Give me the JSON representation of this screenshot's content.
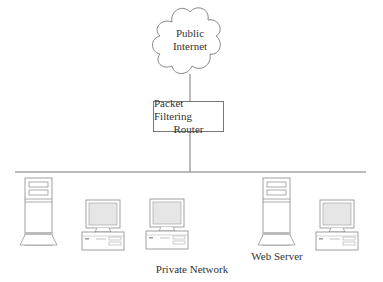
{
  "diagram": {
    "cloud": {
      "line1": "Public",
      "line2": "Internet"
    },
    "router": {
      "line1": "Packet Filtering",
      "line2": "Router"
    },
    "nodes": [
      {
        "type": "tower-server",
        "label": ""
      },
      {
        "type": "workstation",
        "label": ""
      },
      {
        "type": "workstation",
        "label": ""
      },
      {
        "type": "tower-server",
        "label": "Web Server"
      },
      {
        "type": "workstation",
        "label": ""
      }
    ],
    "network_label": "Private Network",
    "colors": {
      "line": "#777777",
      "screen": "#e6e6e6",
      "stripe": "#bbbbbb"
    }
  }
}
